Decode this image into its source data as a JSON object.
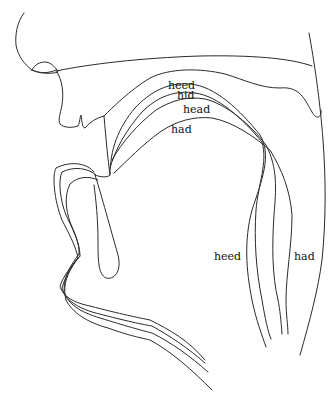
{
  "diagram": {
    "title": "",
    "vowel_labels_upper": [
      {
        "text": "heed",
        "x": 168,
        "y": 89
      },
      {
        "text": "hid",
        "x": 177,
        "y": 99
      },
      {
        "text": "head",
        "x": 183,
        "y": 113
      },
      {
        "text": "had",
        "x": 171,
        "y": 133
      }
    ],
    "vowel_labels_lower": [
      {
        "text": "heed",
        "x": 214,
        "y": 260
      },
      {
        "text": "had",
        "x": 294,
        "y": 260
      }
    ],
    "stroke_color": "#2a2a2a",
    "background": "#ffffff",
    "structures": [
      "nose",
      "upper-lip",
      "hard-palate",
      "velum",
      "pharyngeal-wall",
      "lower-lip",
      "lower-jaw",
      "tongue-heed",
      "tongue-hid",
      "tongue-head",
      "tongue-had"
    ]
  }
}
